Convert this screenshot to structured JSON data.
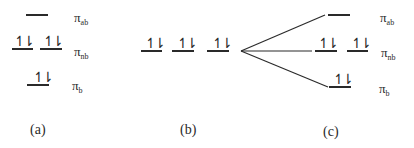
{
  "panels": {
    "a": {
      "caption": "(a)",
      "labels": {
        "ab": "π",
        "ab_sub": "ab",
        "nb": "π",
        "nb_sub": "nb",
        "b": "π",
        "b_sub": "b"
      },
      "spins": {
        "nb1": "↿⇂",
        "nb2": "↿⇂",
        "b": "↿⇂"
      }
    },
    "b": {
      "caption": "(b)",
      "spins": {
        "l1": "↿⇂",
        "l2": "↿⇂",
        "l3": "↿⇂"
      }
    },
    "c": {
      "caption": "(c)",
      "labels": {
        "ab": "π",
        "ab_sub": "ab",
        "nb": "π",
        "nb_sub": "nb",
        "b": "π",
        "b_sub": "b"
      },
      "spins": {
        "nb1": "↿⇂",
        "nb2": "↿⇂",
        "b": "↿⇂"
      }
    }
  },
  "colors": {
    "line": "#2a2a2a",
    "background": "#ffffff"
  }
}
